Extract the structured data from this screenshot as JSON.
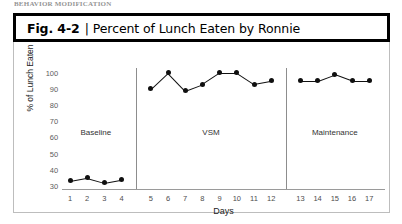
{
  "page_top_text": "BEHAVIOR MODIFICATION",
  "figure": {
    "number_label": "Fig. 4-2",
    "separator": "|",
    "title": "Percent of Lunch Eaten by Ronnie"
  },
  "chart_data": {
    "type": "line",
    "title": "Percent of Lunch Eaten by Ronnie",
    "xlabel": "Days",
    "ylabel": "% of Lunch Eaten",
    "xlim": [
      1,
      17
    ],
    "ylim": [
      28,
      103
    ],
    "yticks": [
      30,
      40,
      50,
      60,
      70,
      80,
      90,
      100
    ],
    "xticks": [
      1,
      2,
      3,
      4,
      5,
      6,
      7,
      8,
      9,
      10,
      11,
      12,
      13,
      14,
      15,
      16,
      17
    ],
    "grid": false,
    "legend": "none",
    "marker": "filled-circle",
    "line_color": "#101010",
    "phases": [
      {
        "name": "Baseline",
        "x": [
          1,
          2,
          3,
          4
        ],
        "values": [
          33,
          35,
          32,
          34
        ]
      },
      {
        "name": "VSM",
        "x": [
          5,
          6,
          7,
          8,
          9,
          10,
          11,
          12
        ],
        "values": [
          90,
          100,
          89,
          93,
          100,
          100,
          93,
          95
        ]
      },
      {
        "name": "Maintenance",
        "x": [
          13,
          14,
          15,
          16,
          17
        ],
        "values": [
          95,
          95,
          99,
          95,
          95
        ]
      }
    ],
    "phase_dividers_after_day": [
      4,
      12
    ]
  }
}
